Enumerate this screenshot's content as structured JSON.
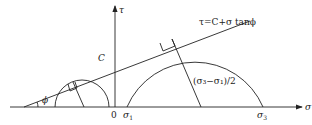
{
  "diagram": {
    "type": "mohr-coulomb-failure-envelope",
    "axes": {
      "x_label": "σ",
      "y_label": "τ",
      "origin_label": "0"
    },
    "envelope": {
      "equation": "τ=C+σ tanϕ",
      "intercept_label": "C",
      "angle_label": "ϕ"
    },
    "circles": [
      {
        "name": "small-mohr-circle"
      },
      {
        "name": "large-mohr-circle",
        "radius_label": "(σ₃−σ₁)/2"
      }
    ],
    "tick_labels": {
      "sigma1": "σ",
      "sigma1_sub": "1",
      "sigma3": "σ",
      "sigma3_sub": "3"
    }
  }
}
